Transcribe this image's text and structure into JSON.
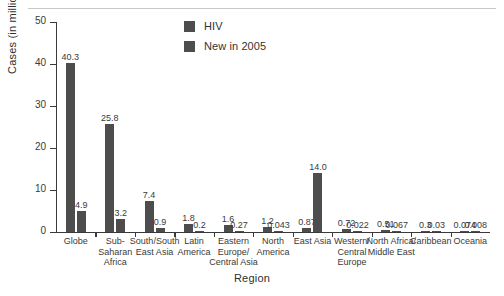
{
  "chart_data": {
    "type": "bar",
    "title": "",
    "xlabel": "Region",
    "ylabel": "Cases (in millions)",
    "ylim": [
      0,
      50
    ],
    "yticks": [
      0,
      10,
      20,
      30,
      40,
      50
    ],
    "grid": false,
    "legend_position": "top-center",
    "categories": [
      "Globe",
      "Sub-\nSaharan\nAfrica",
      "South/South\nEast Asia",
      "Latin\nAmerica",
      "Eastern\nEurope/\nCentral Asia",
      "North\nAmerica",
      "East Asia",
      "Western/\nCentral\nEurope",
      "North Africa/\nMiddle East",
      "Caribbean",
      "Oceania"
    ],
    "series": [
      {
        "name": "HIV",
        "color": "#4d4d4d",
        "values": [
          40.3,
          25.8,
          7.4,
          1.8,
          1.6,
          1.2,
          0.87,
          0.72,
          0.51,
          0.3,
          0.074
        ],
        "labels": [
          "40.3",
          "25.8",
          "7.4",
          "1.8",
          "1.6",
          "1.2",
          "0.87",
          "0.72",
          "0.51",
          "0.3",
          "0.074"
        ]
      },
      {
        "name": "New in 2005",
        "color": "#4d4d4d",
        "values": [
          4.9,
          3.2,
          0.9,
          0.2,
          0.27,
          0.043,
          14.0,
          0.022,
          0.067,
          0.03,
          0.008
        ],
        "labels": [
          "4.9",
          "3.2",
          "0.9",
          "0.2",
          "0.27",
          "0.043",
          "14.0",
          "0.022",
          "0.067",
          "0.03",
          "0.008"
        ]
      }
    ]
  },
  "axes": {
    "y_title": "Cases (in millions)",
    "x_title": "Region",
    "y_tick_labels": [
      "0",
      "10",
      "20",
      "30",
      "40",
      "50"
    ]
  },
  "legend": {
    "items": [
      {
        "label": "HIV",
        "swatch": "#4d4d4d"
      },
      {
        "label": "New in 2005",
        "swatch": "#4d4d4d"
      }
    ]
  }
}
